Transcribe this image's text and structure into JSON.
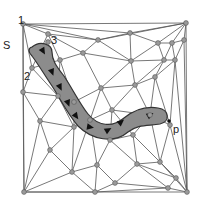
{
  "diagram": {
    "labels": {
      "start": "S",
      "end": "p",
      "node1": "1",
      "node2": "2",
      "node3": "3"
    },
    "colors": {
      "edge": "#555555",
      "node_fill": "#9a9a9a",
      "band_fill": "#8c8c8c",
      "arrow": "#111111",
      "background": "#ffffff"
    },
    "nodes": [
      [
        23,
        24
      ],
      [
        186,
        23
      ],
      [
        24,
        192
      ],
      [
        187,
        192
      ],
      [
        48,
        34
      ],
      [
        32,
        68
      ],
      [
        23,
        92
      ],
      [
        130,
        33
      ],
      [
        158,
        43
      ],
      [
        172,
        43
      ],
      [
        184,
        40
      ],
      [
        98,
        40
      ],
      [
        83,
        53
      ],
      [
        131,
        61
      ],
      [
        164,
        60
      ],
      [
        60,
        60
      ],
      [
        58,
        96
      ],
      [
        74,
        102
      ],
      [
        101,
        88
      ],
      [
        135,
        85
      ],
      [
        155,
        77
      ],
      [
        175,
        60
      ],
      [
        150,
        115
      ],
      [
        170,
        125
      ],
      [
        74,
        127
      ],
      [
        40,
        121
      ],
      [
        110,
        140
      ],
      [
        160,
        162
      ],
      [
        133,
        135
      ],
      [
        50,
        150
      ],
      [
        72,
        172
      ],
      [
        97,
        165
      ],
      [
        137,
        164
      ],
      [
        176,
        178
      ],
      [
        95,
        192
      ],
      [
        115,
        183
      ],
      [
        168,
        188
      ],
      [
        90,
        120
      ],
      [
        48,
        42
      ],
      [
        112,
        110
      ]
    ],
    "edges": [
      [
        0,
        1
      ],
      [
        0,
        2
      ],
      [
        1,
        3
      ],
      [
        2,
        3
      ],
      [
        0,
        4
      ],
      [
        0,
        11
      ],
      [
        0,
        7
      ],
      [
        0,
        5
      ],
      [
        0,
        6
      ],
      [
        4,
        11
      ],
      [
        4,
        12
      ],
      [
        4,
        5
      ],
      [
        4,
        15
      ],
      [
        1,
        7
      ],
      [
        1,
        11
      ],
      [
        1,
        8
      ],
      [
        1,
        9
      ],
      [
        1,
        10
      ],
      [
        7,
        11
      ],
      [
        7,
        8
      ],
      [
        8,
        9
      ],
      [
        9,
        10
      ],
      [
        10,
        3
      ],
      [
        11,
        12
      ],
      [
        11,
        13
      ],
      [
        7,
        13
      ],
      [
        8,
        13
      ],
      [
        8,
        14
      ],
      [
        9,
        14
      ],
      [
        9,
        21
      ],
      [
        10,
        21
      ],
      [
        14,
        21
      ],
      [
        12,
        15
      ],
      [
        12,
        13
      ],
      [
        15,
        5
      ],
      [
        5,
        6
      ],
      [
        5,
        16
      ],
      [
        15,
        16
      ],
      [
        6,
        16
      ],
      [
        6,
        25
      ],
      [
        6,
        2
      ],
      [
        12,
        18
      ],
      [
        13,
        18
      ],
      [
        13,
        19
      ],
      [
        13,
        14
      ],
      [
        14,
        19
      ],
      [
        14,
        20
      ],
      [
        21,
        20
      ],
      [
        21,
        3
      ],
      [
        20,
        23
      ],
      [
        21,
        23
      ],
      [
        15,
        17
      ],
      [
        16,
        17
      ],
      [
        17,
        18
      ],
      [
        18,
        19
      ],
      [
        19,
        20
      ],
      [
        19,
        22
      ],
      [
        20,
        22
      ],
      [
        22,
        23
      ],
      [
        23,
        3
      ],
      [
        16,
        25
      ],
      [
        17,
        24
      ],
      [
        16,
        24
      ],
      [
        24,
        25
      ],
      [
        25,
        2
      ],
      [
        25,
        29
      ],
      [
        24,
        29
      ],
      [
        24,
        37
      ],
      [
        17,
        37
      ],
      [
        18,
        37
      ],
      [
        18,
        39
      ],
      [
        19,
        39
      ],
      [
        39,
        22
      ],
      [
        37,
        39
      ],
      [
        37,
        26
      ],
      [
        39,
        26
      ],
      [
        39,
        28
      ],
      [
        22,
        28
      ],
      [
        28,
        26
      ],
      [
        28,
        27
      ],
      [
        22,
        27
      ],
      [
        23,
        27
      ],
      [
        27,
        3
      ],
      [
        29,
        30
      ],
      [
        24,
        30
      ],
      [
        37,
        30
      ],
      [
        30,
        31
      ],
      [
        37,
        31
      ],
      [
        26,
        31
      ],
      [
        26,
        32
      ],
      [
        28,
        32
      ],
      [
        27,
        32
      ],
      [
        27,
        33
      ],
      [
        33,
        3
      ],
      [
        32,
        33
      ],
      [
        29,
        2
      ],
      [
        30,
        2
      ],
      [
        30,
        34
      ],
      [
        31,
        34
      ],
      [
        31,
        35
      ],
      [
        32,
        35
      ],
      [
        35,
        34
      ],
      [
        35,
        36
      ],
      [
        32,
        36
      ],
      [
        33,
        36
      ],
      [
        36,
        3
      ],
      [
        34,
        2
      ],
      [
        34,
        36
      ]
    ],
    "path_band": "M 32 47 C 40 40, 52 44, 52 52 C 52 60, 56 66, 64 76 C 72 88, 80 104, 88 114 C 98 126, 112 128, 124 118 C 134 110, 146 106, 158 108 C 170 110, 170 122, 160 124 C 148 126, 138 124, 128 132 C 114 144, 92 140, 78 126 C 66 112, 60 98, 52 86 C 44 74, 38 64, 32 56 C 28 52, 28 48, 32 47 Z",
    "arrows": [
      {
        "x": 43,
        "y": 51,
        "angle": 60
      },
      {
        "x": 52,
        "y": 72,
        "angle": 70
      },
      {
        "x": 60,
        "y": 87,
        "angle": 65
      },
      {
        "x": 68,
        "y": 103,
        "angle": 70
      },
      {
        "x": 76,
        "y": 116,
        "angle": 55
      },
      {
        "x": 90,
        "y": 127,
        "angle": 10
      },
      {
        "x": 108,
        "y": 130,
        "angle": -30
      },
      {
        "x": 121,
        "y": 122,
        "angle": -40
      },
      {
        "x": 150,
        "y": 115,
        "angle": -30
      }
    ],
    "label_positions": {
      "node1": {
        "x": 18,
        "y": 16
      },
      "S": {
        "x": 3,
        "y": 41
      },
      "node3": {
        "x": 51,
        "y": 36
      },
      "node2": {
        "x": 24,
        "y": 72
      },
      "p_dot": {
        "x": 169,
        "y": 121
      },
      "p": {
        "x": 173,
        "y": 125
      }
    }
  }
}
